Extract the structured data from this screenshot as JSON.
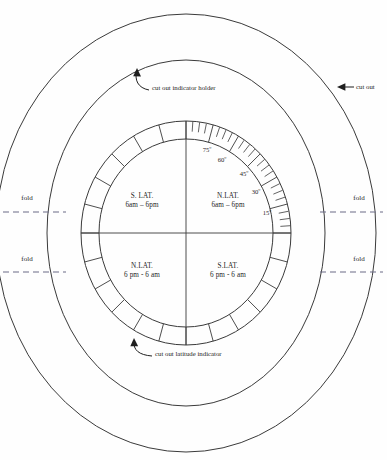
{
  "figure": {
    "name": "latitude indicator cutout template",
    "background_color": "#fefefe",
    "line_color": "#3a3a3a",
    "fold_line_color": "#6b6b86"
  },
  "geometry": {
    "center_x": 186,
    "center_y": 233,
    "outer_oval": {
      "rx": 190,
      "ry": 219
    },
    "middle_oval": {
      "rx": 139,
      "ry": 173
    },
    "ring_outer": {
      "rx": 105,
      "ry": 112
    },
    "ring_inner": {
      "rx": 87,
      "ry": 94
    },
    "segment_count": 24,
    "minor_ticks_per_segment": 3,
    "tick_arc_start_deg": 0,
    "tick_arc_end_deg": 90
  },
  "quadrants": [
    {
      "id": "upper-left",
      "line1": "S. LAT.",
      "line2": "6am – 6pm",
      "x": 142,
      "y": 198
    },
    {
      "id": "upper-right",
      "line1": "N.LAT.",
      "line2": "6am – 6pm",
      "x": 228,
      "y": 198
    },
    {
      "id": "lower-left",
      "line1": "N.LAT.",
      "line2": "6 pm - 6 am",
      "x": 142,
      "y": 268
    },
    {
      "id": "lower-right",
      "line1": "S.LAT.",
      "line2": "6 pm - 6 am",
      "x": 228,
      "y": 268
    }
  ],
  "degree_labels": [
    {
      "text": "75º",
      "angle_deg": 76,
      "x": 207,
      "y": 152
    },
    {
      "text": "60º",
      "angle_deg": 62,
      "x": 222,
      "y": 162
    },
    {
      "text": "45º",
      "angle_deg": 46,
      "x": 244,
      "y": 176
    },
    {
      "text": "30º",
      "angle_deg": 31,
      "x": 256,
      "y": 194
    },
    {
      "text": "15º",
      "angle_deg": 15,
      "x": 267,
      "y": 215
    }
  ],
  "annotations": [
    {
      "id": "cut-out-indicator-holder",
      "text": "cut out indicator holder",
      "text_x": 152,
      "text_y": 90,
      "anchor": "start"
    },
    {
      "id": "cut-out",
      "text": "cut out",
      "text_x": 356,
      "text_y": 89,
      "anchor": "start"
    },
    {
      "id": "cut-out-latitude-indicator",
      "text": "cut out latitude indicator",
      "text_x": 155,
      "text_y": 356,
      "anchor": "start"
    }
  ],
  "fold_labels": [
    {
      "id": "fold-left-upper",
      "text": "fold",
      "x": 27,
      "y": 200,
      "line_y": 212,
      "line_x1": 3,
      "line_x2": 66
    },
    {
      "id": "fold-left-lower",
      "text": "fold",
      "x": 27,
      "y": 261,
      "line_y": 272,
      "line_x1": 3,
      "line_x2": 66
    },
    {
      "id": "fold-right-upper",
      "text": "fold",
      "x": 359,
      "y": 200,
      "line_y": 212,
      "line_x1": 320,
      "line_x2": 383
    },
    {
      "id": "fold-right-lower",
      "text": "fold",
      "x": 359,
      "y": 261,
      "line_y": 272,
      "line_x1": 320,
      "line_x2": 383
    }
  ]
}
